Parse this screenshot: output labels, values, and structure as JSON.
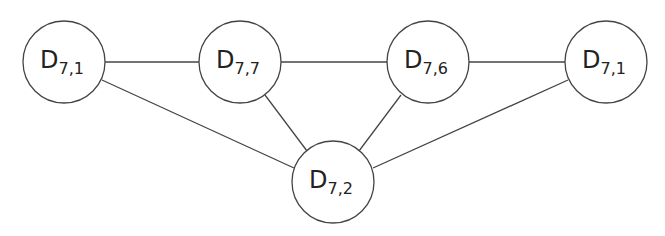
{
  "diagram": {
    "type": "graph",
    "nodes": [
      {
        "id": "n1",
        "base": "D",
        "sub": "7,1",
        "cx": 64,
        "cy": 62
      },
      {
        "id": "n2",
        "base": "D",
        "sub": "7,7",
        "cx": 240,
        "cy": 62
      },
      {
        "id": "n3",
        "base": "D",
        "sub": "7,6",
        "cx": 428,
        "cy": 62
      },
      {
        "id": "n4",
        "base": "D",
        "sub": "7,1",
        "cx": 606,
        "cy": 62
      },
      {
        "id": "n5",
        "base": "D",
        "sub": "7,2",
        "cx": 333,
        "cy": 182
      }
    ],
    "edges": [
      [
        "n1",
        "n2"
      ],
      [
        "n2",
        "n3"
      ],
      [
        "n3",
        "n4"
      ],
      [
        "n1",
        "n5"
      ],
      [
        "n2",
        "n5"
      ],
      [
        "n3",
        "n5"
      ],
      [
        "n4",
        "n5"
      ]
    ],
    "colors": {
      "stroke": "#444444",
      "fill": "#ffffff",
      "text": "#222222"
    }
  }
}
